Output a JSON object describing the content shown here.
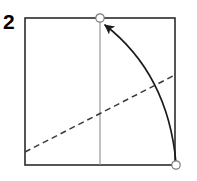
{
  "figure": {
    "step_label": "2",
    "width": 197,
    "height": 181,
    "background_color": "#ffffff"
  },
  "colors": {
    "paper_edge": "#2b2b2b",
    "crease_existing": "#8c8c8c",
    "fold_line_dashed": "#3a3a3a",
    "fold_arrow": "#1a1a1a",
    "vertex_marker_stroke": "#7a7a7a",
    "vertex_marker_fill": "#ffffff",
    "label": "#000000"
  },
  "shapes": {
    "paper_square": {
      "name": "square-sheet",
      "x": 25,
      "y": 18,
      "width": 150,
      "height": 147,
      "stroke_width": 1.6
    },
    "vertical_crease": {
      "name": "vertical-center-crease",
      "x1": 100,
      "y1": 18,
      "x2": 100,
      "y2": 165,
      "stroke_width": 1.1
    },
    "dashed_fold_line": {
      "name": "diagonal-valley-fold",
      "x1": 25,
      "y1": 152,
      "x2": 175,
      "y2": 75,
      "stroke_width": 1.5,
      "dash_pattern": "6 4"
    },
    "fold_arrow": {
      "name": "fold-motion-arrow",
      "start_x": 176,
      "start_y": 163,
      "control_x": 168,
      "control_y": 74,
      "end_x": 105,
      "end_y": 25,
      "stroke_width": 1.6,
      "arrowhead_length": 11,
      "arrowhead_width": 8
    },
    "markers": [
      {
        "name": "vertex-marker-top",
        "cx": 100,
        "cy": 18,
        "r": 4.2,
        "stroke_width": 1.2
      },
      {
        "name": "vertex-marker-bottom-right",
        "cx": 176,
        "cy": 165,
        "r": 4.2,
        "stroke_width": 1.2
      }
    ]
  },
  "annotations": {
    "arrow_meaning": "bring bottom-right corner up to top-center point",
    "dashed_meaning": "fold along this line"
  }
}
